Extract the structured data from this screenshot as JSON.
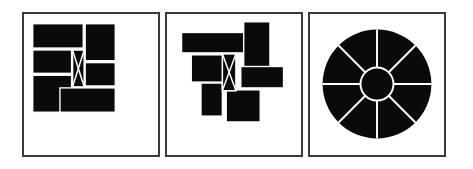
{
  "figure": {
    "title": "",
    "background_color": "#ffffff",
    "width": 473,
    "height": 169,
    "panel_count": 3,
    "panel_border_color": "#3a3a3a",
    "piece_fill_color": "#0a0a0a",
    "gap_color": "#ffffff"
  },
  "panels": [
    {
      "id": "panel-assembled-square",
      "label": "assembled square puzzle",
      "x": 22,
      "y": 12,
      "width": 138,
      "height": 145,
      "description": "Black rectangular pieces assembled into a square with thin white seams and a central bowtie piece marked with a white X",
      "pieces": [
        {
          "name": "top-left-wide",
          "x": 31,
          "y": 22,
          "w": 52,
          "h": 25
        },
        {
          "name": "top-right",
          "x": 85,
          "y": 22,
          "w": 31,
          "h": 38
        },
        {
          "name": "mid-left-upper",
          "x": 31,
          "y": 49,
          "w": 40,
          "h": 24
        },
        {
          "name": "mid-left-lower",
          "x": 31,
          "y": 75,
          "w": 40,
          "h": 38
        },
        {
          "name": "mid-right-upper",
          "x": 85,
          "y": 62,
          "w": 31,
          "h": 24
        },
        {
          "name": "bottom-wide",
          "x": 59,
          "y": 88,
          "w": 57,
          "h": 25
        },
        {
          "name": "center-bowtie",
          "x": 72,
          "y": 49,
          "w": 12,
          "h": 38
        }
      ],
      "center_marker": {
        "type": "x-cross",
        "color": "#ffffff"
      }
    },
    {
      "id": "panel-scattered-pieces",
      "label": "disassembled scattered pieces",
      "x": 165,
      "y": 12,
      "width": 138,
      "height": 145,
      "description": "The same black rectangular pieces displaced and overlapping, the central bowtie piece with white X still visible",
      "pieces": [
        {
          "name": "wide-bar-top-left",
          "x": 180,
          "y": 31,
          "w": 64,
          "h": 21
        },
        {
          "name": "tall-bar-upper-right",
          "x": 244,
          "y": 20,
          "w": 27,
          "h": 51
        },
        {
          "name": "block-mid-left",
          "x": 190,
          "y": 54,
          "w": 36,
          "h": 28
        },
        {
          "name": "bar-mid-right",
          "x": 241,
          "y": 66,
          "w": 44,
          "h": 22
        },
        {
          "name": "block-lower-left",
          "x": 200,
          "y": 83,
          "w": 22,
          "h": 34
        },
        {
          "name": "block-bottom-center",
          "x": 226,
          "y": 90,
          "w": 35,
          "h": 33
        },
        {
          "name": "center-bowtie",
          "x": 222,
          "y": 53,
          "w": 14,
          "h": 38
        }
      ],
      "center_marker": {
        "type": "x-cross",
        "color": "#ffffff"
      }
    },
    {
      "id": "panel-radial-wheel",
      "label": "radial spoked disc",
      "x": 308,
      "y": 12,
      "width": 138,
      "height": 145,
      "description": "Solid black disc divided by eight white radial spokes with a white inner hub ring",
      "disc": {
        "cx": 377,
        "cy": 84,
        "r": 56,
        "fill": "#0a0a0a"
      },
      "hub": {
        "cx": 377,
        "cy": 84,
        "r": 17,
        "stroke": "#ffffff"
      },
      "spoke_count": 8,
      "spoke_angles_deg": [
        0,
        45,
        90,
        135,
        180,
        225,
        270,
        315
      ],
      "spoke_color": "#ffffff"
    }
  ]
}
